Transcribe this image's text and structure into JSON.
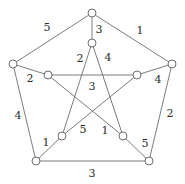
{
  "figure": {
    "width": 185,
    "height": 184,
    "background_color": "#ffffff",
    "edge_color": "#6d6d6d",
    "vertex_fill_color": "#ffffff",
    "vertex_stroke_color": "#5f5f5f",
    "label_color": "#2b2b2b"
  },
  "vertices": [
    {
      "id": "outer-top",
      "name": "outer-vertex-top",
      "x": 92,
      "y": 13,
      "r": 4
    },
    {
      "id": "outer-right",
      "name": "outer-vertex-right",
      "x": 172,
      "y": 64,
      "r": 4
    },
    {
      "id": "outer-bottom-right",
      "name": "outer-vertex-bottom-right",
      "x": 149,
      "y": 161,
      "r": 4
    },
    {
      "id": "outer-bottom-left",
      "name": "outer-vertex-bottom-left",
      "x": 36,
      "y": 161,
      "r": 4
    },
    {
      "id": "outer-left",
      "name": "outer-vertex-left",
      "x": 13,
      "y": 64,
      "r": 4
    },
    {
      "id": "inner-top",
      "name": "inner-vertex-top",
      "x": 92,
      "y": 43,
      "r": 4
    },
    {
      "id": "inner-right",
      "name": "inner-vertex-right",
      "x": 137,
      "y": 75,
      "r": 4
    },
    {
      "id": "inner-bottom-right",
      "name": "inner-vertex-bottom-right",
      "x": 123,
      "y": 136,
      "r": 4
    },
    {
      "id": "inner-bottom-left",
      "name": "inner-vertex-bottom-left",
      "x": 62,
      "y": 136,
      "r": 4
    },
    {
      "id": "inner-left",
      "name": "inner-vertex-left",
      "x": 48,
      "y": 75,
      "r": 4
    }
  ],
  "edges": [
    {
      "id": "e-outer-top-left",
      "name": "edge-outer-top-left",
      "from": "outer-top",
      "to": "outer-left",
      "label": "5",
      "label_x": 47,
      "label_y": 27
    },
    {
      "id": "e-outer-top-right",
      "name": "edge-outer-top-right",
      "from": "outer-top",
      "to": "outer-right",
      "label": "1",
      "label_x": 140,
      "label_y": 30
    },
    {
      "id": "e-outer-right-side",
      "name": "edge-outer-right",
      "from": "outer-right",
      "to": "outer-bottom-right",
      "label": "2",
      "label_x": 170,
      "label_y": 113
    },
    {
      "id": "e-outer-bottom",
      "name": "edge-outer-bottom",
      "from": "outer-bottom-right",
      "to": "outer-bottom-left",
      "label": "3",
      "label_x": 92,
      "label_y": 173
    },
    {
      "id": "e-outer-left-side",
      "name": "edge-outer-left",
      "from": "outer-bottom-left",
      "to": "outer-left",
      "label": "4",
      "label_x": 18,
      "label_y": 115
    },
    {
      "id": "e-spoke-top",
      "name": "edge-spoke-top",
      "from": "outer-top",
      "to": "inner-top",
      "label": "3",
      "label_x": 99,
      "label_y": 29
    },
    {
      "id": "e-spoke-right",
      "name": "edge-spoke-right",
      "from": "outer-right",
      "to": "inner-right",
      "label": "4",
      "label_x": 158,
      "label_y": 79
    },
    {
      "id": "e-spoke-bottom-right",
      "name": "edge-spoke-bottom-right",
      "from": "outer-bottom-right",
      "to": "inner-bottom-right",
      "label": "5",
      "label_x": 145,
      "label_y": 143
    },
    {
      "id": "e-spoke-bottom-left",
      "name": "edge-spoke-bottom-left",
      "from": "outer-bottom-left",
      "to": "inner-bottom-left",
      "label": "1",
      "label_x": 46,
      "label_y": 142
    },
    {
      "id": "e-spoke-left",
      "name": "edge-spoke-left",
      "from": "outer-left",
      "to": "inner-left",
      "label": "2",
      "label_x": 30,
      "label_y": 78
    },
    {
      "id": "e-star-top-bl",
      "name": "edge-star-top-bottom-left",
      "from": "inner-top",
      "to": "inner-bottom-left",
      "label": "2",
      "label_x": 80,
      "label_y": 58
    },
    {
      "id": "e-star-top-br",
      "name": "edge-star-top-bottom-right",
      "from": "inner-top",
      "to": "inner-bottom-right",
      "label": "4",
      "label_x": 108,
      "label_y": 57
    },
    {
      "id": "e-star-left-right",
      "name": "edge-star-left-right",
      "from": "inner-left",
      "to": "inner-right",
      "label": "3",
      "label_x": 92,
      "label_y": 86
    },
    {
      "id": "e-star-left-br",
      "name": "edge-star-left-bottom-right",
      "from": "inner-left",
      "to": "inner-bottom-right",
      "label": "1",
      "label_x": 105,
      "label_y": 130
    },
    {
      "id": "e-star-right-bl",
      "name": "edge-star-right-bottom-left",
      "from": "inner-right",
      "to": "inner-bottom-left",
      "label": "5",
      "label_x": 83,
      "label_y": 129
    }
  ]
}
